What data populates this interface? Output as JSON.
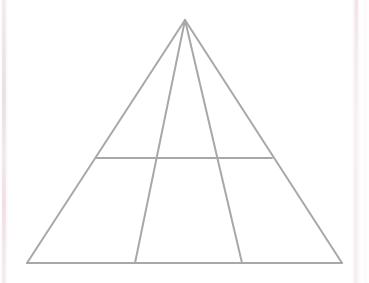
{
  "figure": {
    "canvas": {
      "width": 369,
      "height": 283,
      "background_color": "#ffffff"
    },
    "style": {
      "stroke_color": "#a8a8a8",
      "stroke_width": 2,
      "fill": "none",
      "line_cap": "round"
    },
    "vertices": {
      "apex": {
        "label": "apex",
        "x": 185,
        "y": 20
      },
      "base_left": {
        "label": "base-left",
        "x": 27,
        "y": 263
      },
      "base_right": {
        "label": "base-right",
        "x": 342,
        "y": 263
      },
      "horizontal_left": {
        "label": "horizontal-left",
        "x": 96,
        "y": 158
      },
      "horizontal_right": {
        "label": "horizontal-right",
        "x": 272,
        "y": 158
      },
      "cevian_left_base": {
        "label": "cevian-left-base",
        "x": 135,
        "y": 263
      },
      "cevian_right_base": {
        "label": "cevian-right-base",
        "x": 242,
        "y": 263
      },
      "cevian_left_cross": {
        "label": "cevian-left-crossing",
        "x": 155,
        "y": 158
      },
      "cevian_right_cross": {
        "label": "cevian-right-crossing",
        "x": 214,
        "y": 158
      }
    },
    "lines": [
      {
        "name": "left-edge",
        "x1": 185,
        "y1": 20,
        "x2": 27,
        "y2": 263
      },
      {
        "name": "right-edge",
        "x1": 185,
        "y1": 20,
        "x2": 342,
        "y2": 263
      },
      {
        "name": "base-edge",
        "x1": 27,
        "y1": 263,
        "x2": 342,
        "y2": 263
      },
      {
        "name": "horizontal-divider",
        "x1": 96,
        "y1": 158,
        "x2": 272,
        "y2": 158
      },
      {
        "name": "cevian-left",
        "x1": 185,
        "y1": 20,
        "x2": 135,
        "y2": 263
      },
      {
        "name": "cevian-right",
        "x1": 185,
        "y1": 20,
        "x2": 242,
        "y2": 263
      }
    ],
    "region_count": 6,
    "artifacts": {
      "left_band_color": "#e8dade",
      "right_band_color": "#f3dee2"
    }
  }
}
